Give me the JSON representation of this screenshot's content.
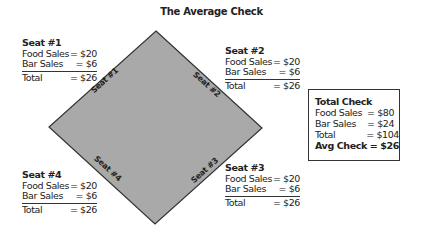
{
  "title": "The Average Check",
  "colors": {
    "diamond_fill": "#a9a9a9",
    "diamond_stroke": "#333333",
    "text": "#222222",
    "background": "#ffffff"
  },
  "diamond": {
    "top": [
      156,
      31
    ],
    "right": [
      262,
      128
    ],
    "bottom": [
      155,
      224
    ],
    "left": [
      49,
      127
    ]
  },
  "edge_labels": [
    "Seat #1",
    "Seat #2",
    "Seat #3",
    "Seat #4"
  ],
  "seats": [
    {
      "name": "Seat #1",
      "food_label": "Food Sales",
      "food": "= $20",
      "bar_label": "Bar Sales",
      "bar": "= $6",
      "total_label": "Total",
      "total": "= $26"
    },
    {
      "name": "Seat #2",
      "food_label": "Food Sales",
      "food": "= $20",
      "bar_label": "Bar Sales",
      "bar": "= $6",
      "total_label": "Total",
      "total": "= $26"
    },
    {
      "name": "Seat #3",
      "food_label": "Food Sales",
      "food": "= $20",
      "bar_label": "Bar Sales",
      "bar": "= $6",
      "total_label": "Total",
      "total": "= $26"
    },
    {
      "name": "Seat #4",
      "food_label": "Food Sales",
      "food": "= $20",
      "bar_label": "Bar Sales",
      "bar": "= $6",
      "total_label": "Total",
      "total": "= $26"
    }
  ],
  "total_check": {
    "heading": "Total Check",
    "food_label": "Food Sales",
    "food": "= $80",
    "bar_label": "Bar Sales",
    "bar": "= $24",
    "total_label": "Total",
    "total": "= $104",
    "avg_label": "Avg Check",
    "avg": "= $26"
  }
}
